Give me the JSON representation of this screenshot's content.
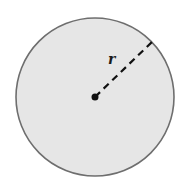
{
  "diagram": {
    "type": "circle-radius",
    "circle": {
      "cx": 95,
      "cy": 97,
      "r": 79,
      "fill": "#e6e6e6",
      "stroke": "#6e6e6e"
    },
    "center_point": {
      "cx": 95,
      "cy": 97,
      "r": 3.5,
      "color": "#111111"
    },
    "radius_line": {
      "x1": 95,
      "y1": 97,
      "x2": 153,
      "y2": 41,
      "style": "dashed",
      "color": "#111111"
    },
    "radius_label": {
      "text": "r",
      "x": 111,
      "y": 64
    }
  }
}
